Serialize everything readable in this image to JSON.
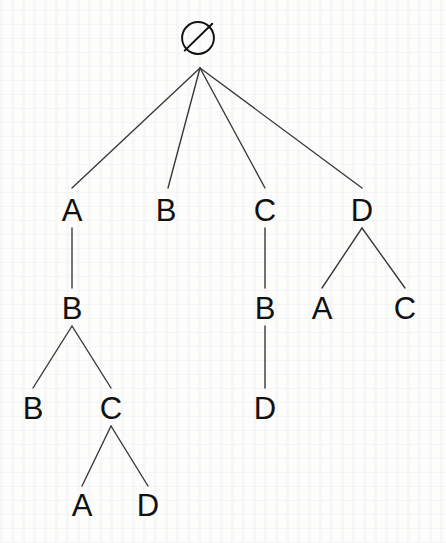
{
  "diagram": {
    "root": {
      "id": "root",
      "label": "∅",
      "icon": "empty-set-symbol",
      "x": 198,
      "y": 38
    },
    "geometry": {
      "width": 446,
      "height": 543,
      "root_edge_origin": {
        "x": 200,
        "y": 68
      },
      "edge_color": "#3a3a3a",
      "label_color": "#111111",
      "background_color": "#fdfdfc",
      "font_size_px": 31,
      "edge_width_px": 1.4
    },
    "levels": [
      {
        "name": "level-0",
        "y": 38
      },
      {
        "name": "level-1",
        "y": 210
      },
      {
        "name": "level-2",
        "y": 308
      },
      {
        "name": "level-3",
        "y": 408
      },
      {
        "name": "level-4",
        "y": 505
      }
    ],
    "nodes": [
      {
        "id": "n1",
        "label": "A",
        "x": 72,
        "y": 210,
        "level": 1,
        "parent": "root"
      },
      {
        "id": "n2",
        "label": "B",
        "x": 166,
        "y": 210,
        "level": 1,
        "parent": "root"
      },
      {
        "id": "n3",
        "label": "C",
        "x": 265,
        "y": 210,
        "level": 1,
        "parent": "root"
      },
      {
        "id": "n4",
        "label": "D",
        "x": 362,
        "y": 210,
        "level": 1,
        "parent": "root"
      },
      {
        "id": "n5",
        "label": "B",
        "x": 72,
        "y": 308,
        "level": 2,
        "parent": "n1"
      },
      {
        "id": "n6",
        "label": "B",
        "x": 265,
        "y": 308,
        "level": 2,
        "parent": "n3"
      },
      {
        "id": "n7",
        "label": "A",
        "x": 322,
        "y": 308,
        "level": 2,
        "parent": "n4"
      },
      {
        "id": "n8",
        "label": "C",
        "x": 405,
        "y": 308,
        "level": 2,
        "parent": "n4"
      },
      {
        "id": "n9",
        "label": "B",
        "x": 33,
        "y": 408,
        "level": 3,
        "parent": "n5"
      },
      {
        "id": "n10",
        "label": "C",
        "x": 111,
        "y": 408,
        "level": 3,
        "parent": "n5"
      },
      {
        "id": "n11",
        "label": "D",
        "x": 265,
        "y": 408,
        "level": 3,
        "parent": "n6"
      },
      {
        "id": "n12",
        "label": "A",
        "x": 82,
        "y": 505,
        "level": 4,
        "parent": "n10"
      },
      {
        "id": "n13",
        "label": "D",
        "x": 148,
        "y": 505,
        "level": 4,
        "parent": "n10"
      }
    ],
    "edges": [
      {
        "from": "root",
        "to": "n1",
        "x1": 200,
        "y1": 68,
        "x2": 72,
        "y2": 188
      },
      {
        "from": "root",
        "to": "n2",
        "x1": 200,
        "y1": 68,
        "x2": 168,
        "y2": 188
      },
      {
        "from": "root",
        "to": "n3",
        "x1": 200,
        "y1": 68,
        "x2": 265,
        "y2": 188
      },
      {
        "from": "root",
        "to": "n4",
        "x1": 200,
        "y1": 68,
        "x2": 362,
        "y2": 188
      },
      {
        "from": "n1",
        "to": "n5",
        "x1": 72,
        "y1": 228,
        "x2": 72,
        "y2": 288
      },
      {
        "from": "n3",
        "to": "n6",
        "x1": 265,
        "y1": 228,
        "x2": 265,
        "y2": 288
      },
      {
        "from": "n4",
        "to": "n7",
        "x1": 362,
        "y1": 228,
        "x2": 322,
        "y2": 288
      },
      {
        "from": "n4",
        "to": "n8",
        "x1": 362,
        "y1": 228,
        "x2": 405,
        "y2": 288
      },
      {
        "from": "n5",
        "to": "n9",
        "x1": 72,
        "y1": 326,
        "x2": 33,
        "y2": 388
      },
      {
        "from": "n5",
        "to": "n10",
        "x1": 72,
        "y1": 326,
        "x2": 111,
        "y2": 388
      },
      {
        "from": "n6",
        "to": "n11",
        "x1": 265,
        "y1": 326,
        "x2": 265,
        "y2": 388
      },
      {
        "from": "n10",
        "to": "n12",
        "x1": 111,
        "y1": 426,
        "x2": 82,
        "y2": 486
      },
      {
        "from": "n10",
        "to": "n13",
        "x1": 111,
        "y1": 426,
        "x2": 148,
        "y2": 486
      }
    ]
  }
}
